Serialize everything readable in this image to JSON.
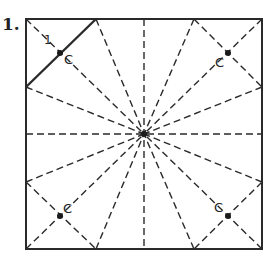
{
  "diagram": {
    "step_number": "1.",
    "fold_label": "1",
    "point_labels": [
      "C",
      "C",
      "C",
      "C"
    ],
    "colors": {
      "line": "#2a2a2a",
      "background": "#ffffff"
    },
    "square": {
      "x1": 26,
      "y1": 19,
      "x2": 262,
      "y2": 249
    },
    "center": [
      144,
      134
    ],
    "edge_points": {
      "top": [
        96,
        194
      ],
      "bottom": [
        96,
        194
      ],
      "left": [
        87,
        182
      ],
      "right": [
        87,
        182
      ]
    },
    "solid_fold": {
      "from": [
        26,
        87
      ],
      "to": [
        96,
        19
      ]
    },
    "c_points": [
      [
        60,
        53
      ],
      [
        228,
        53
      ],
      [
        60,
        216
      ],
      [
        228,
        216
      ]
    ]
  }
}
